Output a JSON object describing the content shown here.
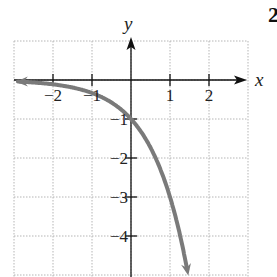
{
  "problem_number": "2",
  "chart_data": {
    "type": "line",
    "title": "",
    "function": "y = -3^x",
    "xlabel": "x",
    "ylabel": "y",
    "xlim": [
      -3,
      3
    ],
    "ylim": [
      -5,
      1
    ],
    "grid": true,
    "grid_style": "dotted",
    "x_ticks": [
      -2,
      -1,
      1,
      2
    ],
    "x_tick_labels": [
      "−2",
      "−1",
      "1",
      "2"
    ],
    "y_ticks": [
      -1,
      -2,
      -3,
      -4
    ],
    "y_tick_labels": [
      "−1",
      "−2",
      "−3",
      "−4"
    ],
    "series": [
      {
        "name": "y = -3^x",
        "color": "#7a7a7a",
        "arrows": "both",
        "x": [
          -2.95,
          -2,
          -1,
          0,
          0.5,
          1,
          1.2,
          1.4,
          1.5
        ],
        "y": [
          -0.04,
          -0.11,
          -0.33,
          -1,
          -1.73,
          -3,
          -3.74,
          -4.66,
          -5.0
        ]
      }
    ],
    "intercepts": {
      "y_intercept": [
        0,
        -1
      ]
    },
    "asymptote": "y = 0"
  },
  "colors": {
    "axis": "#111111",
    "grid": "#b5b5b5",
    "curve": "#7a7a7a"
  }
}
